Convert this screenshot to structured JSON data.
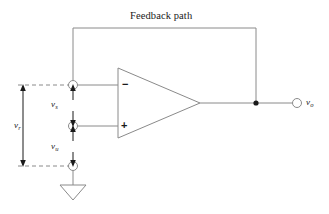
{
  "figure": {
    "kind": "op-amp-feedback-circuit-diagram",
    "stroke_color": "#8a8a8a",
    "text_color": "#1a1a1a",
    "background_color": "#ffffff",
    "feedback_label": "Feedback path",
    "amplifier": {
      "inverting_sign": "−",
      "noninverting_sign": "+"
    },
    "labels": {
      "v_r": {
        "symbol": "v",
        "subscript": "r"
      },
      "v_s": {
        "symbol": "v",
        "subscript": "s"
      },
      "v_u": {
        "symbol": "v",
        "subscript": "u"
      },
      "v_o": {
        "symbol": "v",
        "subscript": "o"
      }
    },
    "terminals": [
      {
        "name": "inverting-input-terminal"
      },
      {
        "name": "noninverting-input-terminal"
      },
      {
        "name": "ground-terminal"
      },
      {
        "name": "output-terminal"
      }
    ],
    "nodes": [
      {
        "name": "output-junction-node"
      }
    ],
    "symbols": [
      {
        "name": "ground-symbol"
      }
    ]
  }
}
